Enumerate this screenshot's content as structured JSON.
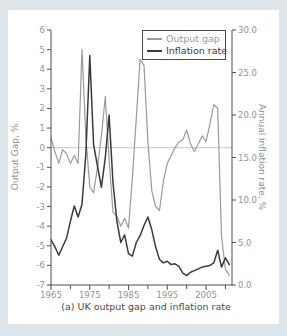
{
  "figure": {
    "caption": "(a) UK output gap and inflation rate"
  },
  "legend": {
    "items": [
      {
        "label": "Output gap",
        "series": "output_gap"
      },
      {
        "label": "Inflation rate",
        "series": "inflation_rate"
      }
    ]
  },
  "colors": {
    "output_gap": "#9a9a9a",
    "inflation_rate": "#3a3a3a",
    "axis_line": "#4f4f4f",
    "tick_label": "#8f9396",
    "zero_line": "#a9adb0",
    "panel_bg": "#ffffff",
    "page_bg": "#dfe6eb",
    "caption_text": "#4a4a4a"
  },
  "chart_data": {
    "type": "line",
    "title": "",
    "caption": "(a) UK output gap and inflation rate",
    "grid": "zero-line only",
    "legend_position": "top-right inside plot",
    "x": [
      1965,
      1966,
      1967,
      1968,
      1969,
      1970,
      1971,
      1972,
      1973,
      1974,
      1975,
      1976,
      1977,
      1978,
      1979,
      1980,
      1981,
      1982,
      1983,
      1984,
      1985,
      1986,
      1987,
      1988,
      1989,
      1990,
      1991,
      1992,
      1993,
      1994,
      1995,
      1996,
      1997,
      1998,
      1999,
      2000,
      2001,
      2002,
      2003,
      2004,
      2005,
      2006,
      2007,
      2008,
      2009,
      2010,
      2011
    ],
    "series": [
      {
        "name": "Output gap",
        "axis": "left",
        "color_key": "output_gap",
        "values": [
          0.5,
          -0.2,
          -0.8,
          -0.1,
          -0.3,
          -0.8,
          -0.4,
          -0.8,
          5.0,
          0.5,
          -2.0,
          -2.3,
          -1.0,
          0.6,
          2.6,
          -0.6,
          -3.3,
          -3.5,
          -4.0,
          -3.6,
          -4.1,
          -1.5,
          1.5,
          4.5,
          4.2,
          0.3,
          -2.2,
          -3.0,
          -3.2,
          -1.7,
          -0.8,
          -0.4,
          0.0,
          0.3,
          0.4,
          0.9,
          0.2,
          -0.2,
          0.2,
          0.6,
          0.3,
          1.2,
          2.2,
          2.0,
          -4.5,
          -6.2,
          -6.5
        ]
      },
      {
        "name": "Inflation rate",
        "axis": "right",
        "color_key": "inflation_rate",
        "values": [
          5.3,
          4.5,
          3.5,
          4.5,
          5.5,
          7.5,
          9.3,
          8.0,
          9.5,
          15.5,
          27.0,
          16.5,
          14.0,
          11.5,
          15.0,
          20.0,
          12.0,
          7.5,
          5.0,
          5.9,
          3.7,
          3.4,
          5.0,
          5.8,
          7.0,
          8.0,
          6.5,
          4.5,
          3.0,
          2.6,
          2.8,
          2.4,
          2.5,
          2.2,
          1.4,
          1.1,
          1.5,
          1.7,
          1.9,
          2.1,
          2.2,
          2.3,
          2.6,
          4.1,
          2.1,
          3.2,
          2.4
        ]
      }
    ],
    "left_axis": {
      "label": "Output Gap, %",
      "min": -7,
      "max": 6,
      "ticks": [
        6,
        5,
        4,
        3,
        2,
        1,
        0,
        -1,
        -2,
        -3,
        -4,
        -5,
        -6,
        -7
      ]
    },
    "right_axis": {
      "label": "Annual inflation rate, %",
      "min": 0,
      "max": 30,
      "ticks": [
        30,
        25,
        20,
        15,
        10,
        5,
        0
      ],
      "tick_labels": [
        "30.0",
        "25.0",
        "20.0",
        "15.0",
        "10.0",
        "5.0",
        "0.0"
      ]
    },
    "x_axis": {
      "min": 1965,
      "max": 2011.7,
      "minor_ticks": [
        1965,
        1970,
        1975,
        1980,
        1985,
        1990,
        1995,
        2000,
        2005,
        2010
      ],
      "major_ticks": [
        1965,
        1975,
        1985,
        1995,
        2005
      ],
      "labels": [
        "1965",
        "1975",
        "1985",
        "1995",
        "2005"
      ]
    },
    "zero_line": true
  }
}
